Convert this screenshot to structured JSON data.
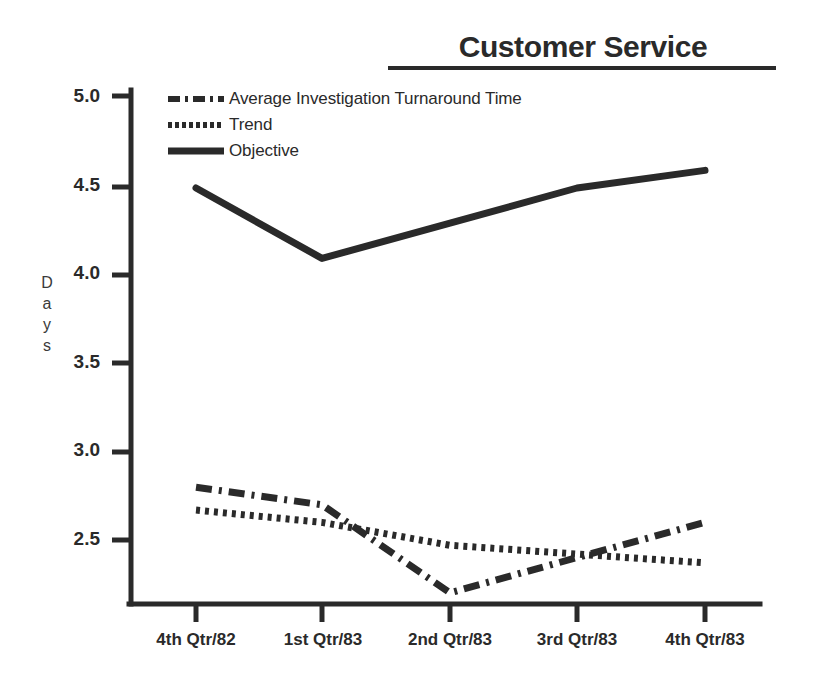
{
  "chart_data": {
    "type": "line",
    "title": "Customer Service",
    "xlabel": "",
    "ylabel": "Days",
    "categories": [
      "4th Qtr/82",
      "1st Qtr/83",
      "2nd Qtr/83",
      "3rd Qtr/83",
      "4th Qtr/83"
    ],
    "yticks": [
      "2.5",
      "3.0",
      "3.5",
      "4.0",
      "4.5",
      "5.0"
    ],
    "ylim": [
      2.1,
      5.15
    ],
    "grid": false,
    "legend_position": "upper-left",
    "series": [
      {
        "name": "Average Investigation Turnaround Time",
        "style": "dash-dot",
        "values": [
          2.8,
          2.7,
          2.2,
          2.4,
          2.6
        ]
      },
      {
        "name": "Trend",
        "style": "dotted",
        "values": [
          2.67,
          2.6,
          2.47,
          2.42,
          2.37
        ]
      },
      {
        "name": "Objective",
        "style": "solid",
        "values": [
          4.5,
          4.1,
          4.3,
          4.5,
          4.6
        ]
      }
    ]
  },
  "legend": {
    "items": [
      {
        "label": "Average Investigation Turnaround Time",
        "key": "dash-dot-line-key"
      },
      {
        "label": "Trend",
        "key": "dotted-line-key"
      },
      {
        "label": "Objective",
        "key": "solid-line-key"
      }
    ]
  },
  "axes": {
    "y_title_letters": [
      "D",
      "a",
      "y",
      "s"
    ],
    "y_labels": [
      "5.0",
      "4.5",
      "4.0",
      "3.5",
      "3.0",
      "2.5"
    ],
    "x_labels": [
      "4th Qtr/82",
      "1st Qtr/83",
      "2nd Qtr/83",
      "3rd Qtr/83",
      "4th Qtr/83"
    ]
  },
  "colors": {
    "ink": "#2a2a2a",
    "background": "#ffffff"
  }
}
